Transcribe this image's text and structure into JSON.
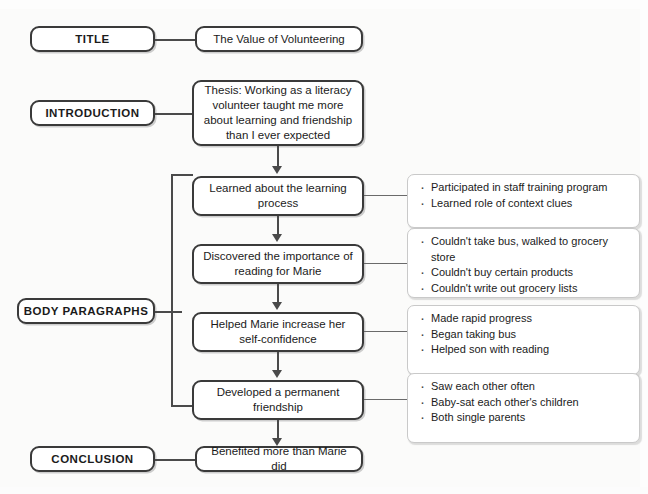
{
  "diagram": {
    "title_section": {
      "label": "TITLE",
      "content": "The Value of Volunteering"
    },
    "introduction_section": {
      "label": "INTRODUCTION",
      "content": "Thesis: Working as a literacy volunteer taught me more about learning and friendship than I ever expected"
    },
    "body_section": {
      "label": "BODY PARAGRAPHS",
      "paragraphs": [
        {
          "content": "Learned about the learning process",
          "details": [
            "Participated in staff training program",
            "Learned role of context clues"
          ]
        },
        {
          "content": "Discovered the importance of reading for Marie",
          "details": [
            "Couldn't take bus, walked to grocery store",
            "Couldn't buy certain products",
            "Couldn't write out grocery lists"
          ]
        },
        {
          "content": "Helped Marie increase her self-confidence",
          "details": [
            "Made rapid progress",
            "Began taking bus",
            "Helped son with reading"
          ]
        },
        {
          "content": "Developed a permanent friendship",
          "details": [
            "Saw each other often",
            "Baby-sat each other's children",
            "Both single parents"
          ]
        }
      ]
    },
    "conclusion_section": {
      "label": "CONCLUSION",
      "content": "Benefited more than Marie did"
    },
    "colors": {
      "background": "#fbfbfa",
      "box_border": "#3a3a3a",
      "bullet_border": "#c9c9c9",
      "connector": "#4a4a4a",
      "text": "#1b1b1b"
    }
  }
}
